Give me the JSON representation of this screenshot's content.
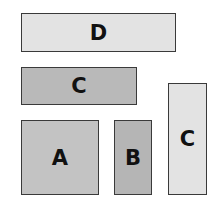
{
  "diagram": {
    "boxes": [
      {
        "id": "D",
        "label": "D",
        "x": 21,
        "y": 13,
        "w": 155,
        "h": 39,
        "fill": "#e3e3e3"
      },
      {
        "id": "C1",
        "label": "C",
        "x": 21,
        "y": 67,
        "w": 116,
        "h": 38,
        "fill": "#b9b9b9"
      },
      {
        "id": "A",
        "label": "A",
        "x": 21,
        "y": 120,
        "w": 78,
        "h": 75,
        "fill": "#c3c3c3"
      },
      {
        "id": "B",
        "label": "B",
        "x": 114,
        "y": 120,
        "w": 38,
        "h": 75,
        "fill": "#b5b5b5"
      },
      {
        "id": "C2",
        "label": "C",
        "x": 168,
        "y": 83,
        "w": 39,
        "h": 112,
        "fill": "#e3e3e3"
      }
    ]
  }
}
